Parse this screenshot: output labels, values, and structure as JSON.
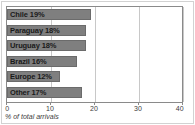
{
  "chart_data": {
    "type": "bar",
    "orientation": "horizontal",
    "title": "",
    "subtitle": "",
    "xlabel": "% of total arrivals",
    "ylabel": "",
    "xlim": [
      0,
      40
    ],
    "ylim": null,
    "grid": true,
    "legend": null,
    "xticks": [
      0,
      10,
      20,
      30,
      40
    ],
    "xtick_labels": [
      "0",
      "10",
      "20",
      "30",
      "40"
    ],
    "categories": [
      "Chile",
      "Paraguay",
      "Uruguay",
      "Brazil",
      "Europe",
      "Other"
    ],
    "values": [
      19,
      18,
      18,
      16,
      12,
      17
    ],
    "bar_labels": [
      "Chile 19%",
      "Paraguay 18%",
      "Uruguay 18%",
      "Brazil 16%",
      "Europe 12%",
      "Other 17%"
    ],
    "series": [
      {
        "name": "% of total arrivals",
        "values": [
          19,
          18,
          18,
          16,
          12,
          17
        ]
      }
    ],
    "colors": {
      "bar_fill": "#7f7f7f",
      "bar_stroke": "#6b6b6b",
      "plot_background": "#ffffff",
      "gridline": "#c8c8c8",
      "axis": "#8a8a8a",
      "label_text": "#1a1a1a",
      "tick_text": "#3c3c3c",
      "frame": "#d2d2d2"
    }
  },
  "caption": {
    "text": "% of total arrivals"
  }
}
